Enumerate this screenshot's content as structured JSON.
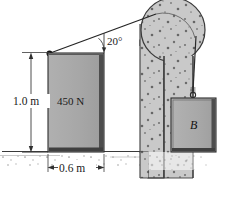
{
  "figure": {
    "labels": {
      "height_dimension": "1.0 m",
      "width_dimension": "0.6 m",
      "cable_angle": "20°",
      "block_weight": "450 N",
      "hanging_block": "B"
    },
    "colors": {
      "block_fill": "#a8a8a8",
      "block_edge": "#2a2a2a",
      "block_shadow": "#4a4a4a",
      "concrete_fill": "#c8c8c8",
      "concrete_edge": "#3a3a3a",
      "speckle": "#6f6f6f",
      "ground_line": "#303030",
      "cable": "#2b2b2b",
      "dimension_line": "#3a3a3a",
      "background": "#ffffff"
    },
    "geometry": {
      "block_width_m": 0.6,
      "block_height_m": 1.0,
      "cable_angle_deg": 20,
      "block_weight_n": 450
    }
  }
}
